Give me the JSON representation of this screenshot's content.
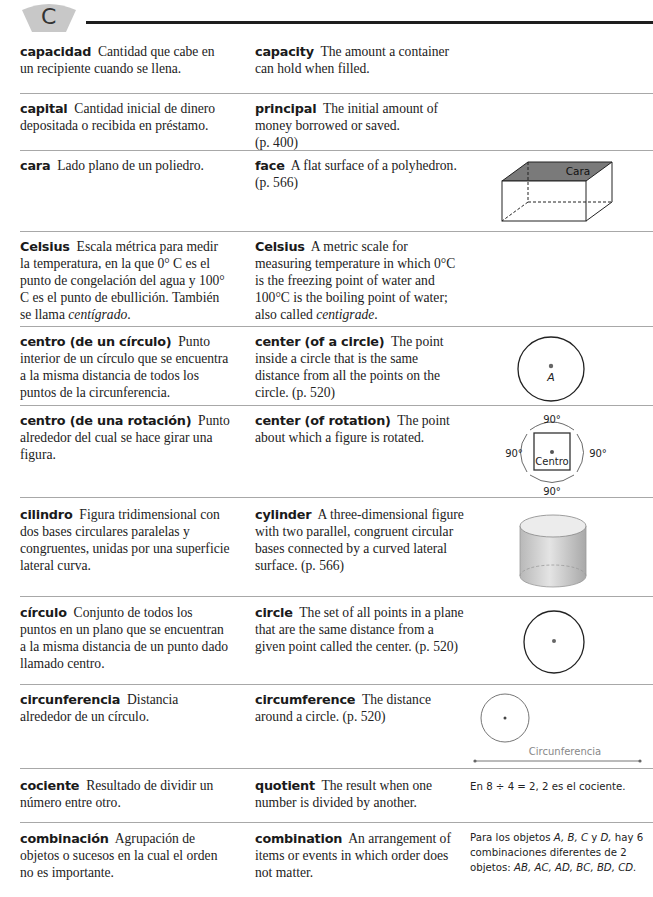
{
  "header": {
    "letter": "C",
    "tab_color": "#c8c8c8",
    "rule_color": "#1e1e1e"
  },
  "entries": [
    {
      "es_term": "capacidad",
      "es_def": "Cantidad que cabe en un recipiente cuando se llena.",
      "en_term": "capacity",
      "en_def": "The amount a container can hold when filled."
    },
    {
      "es_term": "capital",
      "es_def": "Cantidad inicial de dinero depositada o recibida en préstamo.",
      "en_term": "principal",
      "en_def": "The initial amount of money borrowed or saved.",
      "en_page": "(p. 400)"
    },
    {
      "es_term": "cara",
      "es_def": "Lado plano de un poliedro.",
      "en_term": "face",
      "en_def": "A flat surface of a polyhedron. (p. 566)",
      "figure_label": "Cara"
    },
    {
      "es_term": "Celsius",
      "es_def_1": "Escala métrica para medir la temperatura, en la que 0° C es el punto de congelación del agua y 100° C es el punto de ebullición. También se llama ",
      "es_def_italic": "centígrado",
      "es_def_end": ".",
      "en_term": "Celsius",
      "en_def_1": "A metric scale for measuring temperature in which 0°C is the freezing point of water and 100°C is the boiling point of water; also called ",
      "en_def_italic": "centigrade",
      "en_def_end": "."
    },
    {
      "es_term": "centro (de un círculo)",
      "es_def": "Punto interior de un círculo que se encuentra a la misma distancia de todos los puntos de la circunferencia.",
      "en_term": "center (of a circle)",
      "en_def": "The point inside a circle that is the same distance from all the points on the circle. (p. 520)",
      "figure_label": "A"
    },
    {
      "es_term": "centro (de una rotación)",
      "es_def": "Punto alrededor del cual se hace girar una figura.",
      "en_term": "center (of rotation)",
      "en_def": "The point about which a figure is rotated.",
      "figure_label": "Centro",
      "angle_label": "90°"
    },
    {
      "es_term": "cilindro",
      "es_def": "Figura tridimensional con dos bases circulares paralelas y congruentes, unidas por una superficie lateral curva.",
      "en_term": "cylinder",
      "en_def": "A three-dimensional figure with two parallel, congruent circular bases connected by a curved lateral surface. (p. 566)"
    },
    {
      "es_term": "círculo",
      "es_def": "Conjunto de todos los puntos en un plano que se encuentran a la misma distancia de un punto dado llamado centro.",
      "en_term": "circle",
      "en_def": "The set of all points in a plane that are the same distance from a given point called the center. (p. 520)"
    },
    {
      "es_term": "circunferencia",
      "es_def": "Distancia alrededor de un círculo.",
      "en_term": "circumference",
      "en_def": "The distance around a circle. (p. 520)",
      "figure_label": "Circunferencia"
    },
    {
      "es_term": "cociente",
      "es_def": "Resultado de dividir un número entre otro.",
      "en_term": "quotient",
      "en_def": "The result when one number is divided by another.",
      "example": "En 8 ÷ 4 = 2, 2 es el cociente."
    },
    {
      "es_term": "combinación",
      "es_def": "Agrupación de objetos o sucesos en la cual el orden no es importante.",
      "en_term": "combination",
      "en_def": "An arrangement of items or events in which order does not matter.",
      "example_1": "Para los objetos ",
      "example_italic_1": "A, B, C",
      "example_2": " y ",
      "example_italic_2": "D,",
      "example_3": " hay 6 combinaciones diferentes de 2 objetos: ",
      "example_italic_3": "AB, AC, AD, BC, BD, CD."
    }
  ]
}
